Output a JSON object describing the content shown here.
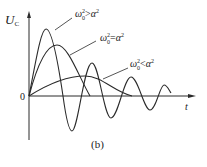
{
  "figure": {
    "caption": "(b)",
    "y_axis_label": "U",
    "y_axis_subscript": "C",
    "x_axis_label": "t",
    "origin_label": "0",
    "curves": [
      {
        "id": "underdamped",
        "label_lhs": "ω",
        "label_sub": "0",
        "label_sup": "2",
        "label_op": ">",
        "label_rhs": "α",
        "label_rhs_sup": "2",
        "description": "damped oscillation"
      },
      {
        "id": "critical",
        "label_lhs": "ω",
        "label_sub": "0",
        "label_sup": "2",
        "label_op": "=",
        "label_rhs": "α",
        "label_rhs_sup": "2",
        "description": "critically damped"
      },
      {
        "id": "overdamped",
        "label_lhs": "ω",
        "label_sub": "0",
        "label_sup": "2",
        "label_op": "<",
        "label_rhs": "α",
        "label_rhs_sup": "2",
        "description": "overdamped"
      }
    ],
    "colors": {
      "line": "#2a2a2a",
      "background": "#ffffff"
    }
  }
}
